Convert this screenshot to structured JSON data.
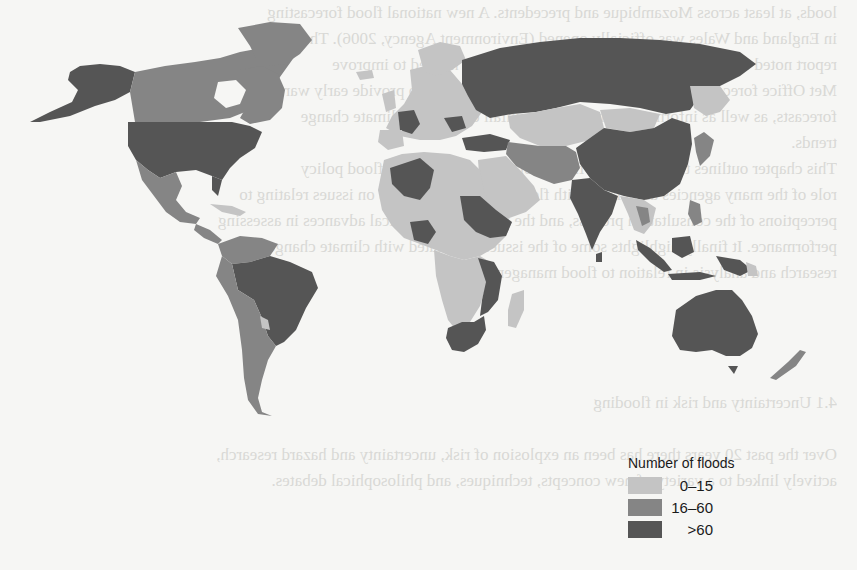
{
  "legend": {
    "title": "Number of floods",
    "items": [
      {
        "label": "0–15",
        "color": "#c4c4c4"
      },
      {
        "label": "16–60",
        "color": "#858585"
      },
      {
        "label": ">60",
        "color": "#555555"
      }
    ]
  },
  "colors": {
    "background": "#f6f6f4",
    "low": "#c4c4c4",
    "mid": "#858585",
    "high": "#555555"
  },
  "regions": [
    {
      "name": "Alaska",
      "category": "high"
    },
    {
      "name": "Canada",
      "category": "mid"
    },
    {
      "name": "Greenland",
      "category": "mid"
    },
    {
      "name": "USA",
      "category": "high"
    },
    {
      "name": "Mexico",
      "category": "mid"
    },
    {
      "name": "Central America",
      "category": "mid"
    },
    {
      "name": "Colombia / Venezuela",
      "category": "mid"
    },
    {
      "name": "Brazil",
      "category": "high"
    },
    {
      "name": "Peru / Chile / Argentina",
      "category": "mid"
    },
    {
      "name": "Europe",
      "category": "low"
    },
    {
      "name": "Russia",
      "category": "high"
    },
    {
      "name": "Kazakhstan / Central Asia",
      "category": "low"
    },
    {
      "name": "Mongolia",
      "category": "low"
    },
    {
      "name": "China",
      "category": "high"
    },
    {
      "name": "India",
      "category": "high"
    },
    {
      "name": "Iran / Middle East",
      "category": "mid"
    },
    {
      "name": "Arabian Peninsula",
      "category": "low"
    },
    {
      "name": "North Africa",
      "category": "low"
    },
    {
      "name": "Algeria",
      "category": "mid"
    },
    {
      "name": "Sudan / Ethiopia",
      "category": "mid"
    },
    {
      "name": "Nigeria",
      "category": "mid"
    },
    {
      "name": "Central/Southern Africa",
      "category": "low"
    },
    {
      "name": "Mozambique / East Africa",
      "category": "mid"
    },
    {
      "name": "South Africa",
      "category": "mid"
    },
    {
      "name": "Madagascar",
      "category": "low"
    },
    {
      "name": "Southeast Asia",
      "category": "low"
    },
    {
      "name": "Indonesia / Philippines",
      "category": "mid"
    },
    {
      "name": "Japan",
      "category": "mid"
    },
    {
      "name": "Australia",
      "category": "mid"
    },
    {
      "name": "New Zealand",
      "category": "mid"
    }
  ],
  "bleed_text": [
    "loods, at least across Mozambique and precedents. A new national flood forecasting",
    "in England and Wales was officially opened (Environment Agency, 2006). The",
    "report noted that rainfall and run-off observations were needed to improve",
    "Met Office forecasts, and the Flood Forecasting Centre aims to provide early warning",
    "forecasts, as well as information on extreme rainfall events and climate change",
    "trends.",
    "   This chapter outlines the provisional framework that an integrated flood policy",
    "role of the many agencies associated with flood risk, with the focus on issues relating to",
    "perceptions of the consultation process, and the role of technological advances in assessing",
    "performance. It finally highlights some of the issues associated with climate change",
    "research and analysis in relation to flood management.",
    "",
    "",
    "",
    "",
    "               4.1  Uncertainty and risk in flooding",
    "",
    "Over the past 20 years there has been an explosion of risk, uncertainty and hazard research,",
    "actively linked to a variety of new concepts, techniques, and philosophical debates.",
    ""
  ]
}
